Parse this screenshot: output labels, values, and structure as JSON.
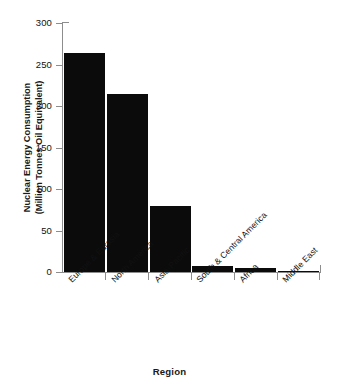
{
  "chart_data": {
    "type": "bar",
    "title": "",
    "xlabel": "Region",
    "ylabel": "Nuclear Energy Consumption (Million Tonnes Oil Equivalent)",
    "ylabel_line1": "Nuclear Energy Consumption",
    "ylabel_line2": "(Million Tonnes Oil Equivalent)",
    "categories": [
      "Europe & Eurasia",
      "North America",
      "Asia-Pacific",
      "South & Central America",
      "Africa",
      "Middle East"
    ],
    "values": [
      264,
      215,
      80,
      7,
      5,
      1
    ],
    "ylim": [
      0,
      300
    ],
    "yticks": [
      0,
      50,
      100,
      150,
      200,
      250,
      300
    ],
    "ytick_labels": [
      "0",
      "50",
      "100",
      "150",
      "200",
      "250",
      "300"
    ],
    "grid": false,
    "legend": false,
    "bar_color": "#0b0b0b",
    "axis_color": "#8d8d8d",
    "background_color": "#ffffff"
  }
}
